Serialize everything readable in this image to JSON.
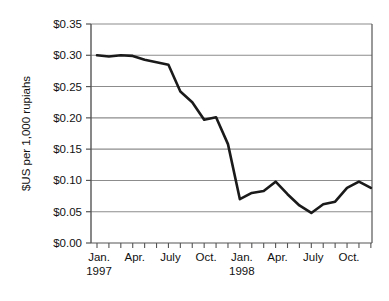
{
  "chart_data": {
    "type": "line",
    "title": "",
    "xlabel": "",
    "ylabel": "$US per 1,000 rupiahs",
    "ylim": [
      0.0,
      0.35
    ],
    "ytick_labels": [
      "$0.00",
      "$0.05",
      "$0.10",
      "$0.15",
      "$0.20",
      "$0.25",
      "$0.30",
      "$0.35"
    ],
    "ytick_values": [
      0.0,
      0.05,
      0.1,
      0.15,
      0.2,
      0.25,
      0.3,
      0.35
    ],
    "grid": "horizontal",
    "legend": "none",
    "x": [
      "Jan. 1997",
      "Feb. 1997",
      "Mar. 1997",
      "Apr. 1997",
      "May 1997",
      "June 1997",
      "July 1997",
      "Aug. 1997",
      "Sept. 1997",
      "Oct. 1997",
      "Nov. 1997",
      "Dec. 1997",
      "Jan. 1998",
      "Feb. 1998",
      "Mar. 1998",
      "Apr. 1998",
      "May 1998",
      "June 1998",
      "July 1998",
      "Aug. 1998",
      "Sept. 1998",
      "Oct. 1998",
      "Nov. 1998",
      "Dec. 1998"
    ],
    "xtick_labels": [
      {
        "index": 0,
        "line1": "Jan.",
        "line2": "1997"
      },
      {
        "index": 3,
        "line1": "Apr.",
        "line2": ""
      },
      {
        "index": 6,
        "line1": "July",
        "line2": ""
      },
      {
        "index": 9,
        "line1": "Oct.",
        "line2": ""
      },
      {
        "index": 12,
        "line1": "Jan.",
        "line2": "1998"
      },
      {
        "index": 15,
        "line1": "Apr.",
        "line2": ""
      },
      {
        "index": 18,
        "line1": "July",
        "line2": ""
      },
      {
        "index": 21,
        "line1": "Oct.",
        "line2": ""
      }
    ],
    "values": [
      0.3,
      0.298,
      0.3,
      0.299,
      0.293,
      0.289,
      0.285,
      0.242,
      0.225,
      0.197,
      0.201,
      0.158,
      0.07,
      0.08,
      0.083,
      0.098,
      0.078,
      0.06,
      0.048,
      0.062,
      0.066,
      0.088,
      0.098,
      0.088
    ],
    "series_name": "Indonesian rupiah exchange rate",
    "line_color": "#1a1a1a",
    "grid_color": "#8c8c8c",
    "axis_color": "#555555",
    "background_color": "#ffffff"
  }
}
